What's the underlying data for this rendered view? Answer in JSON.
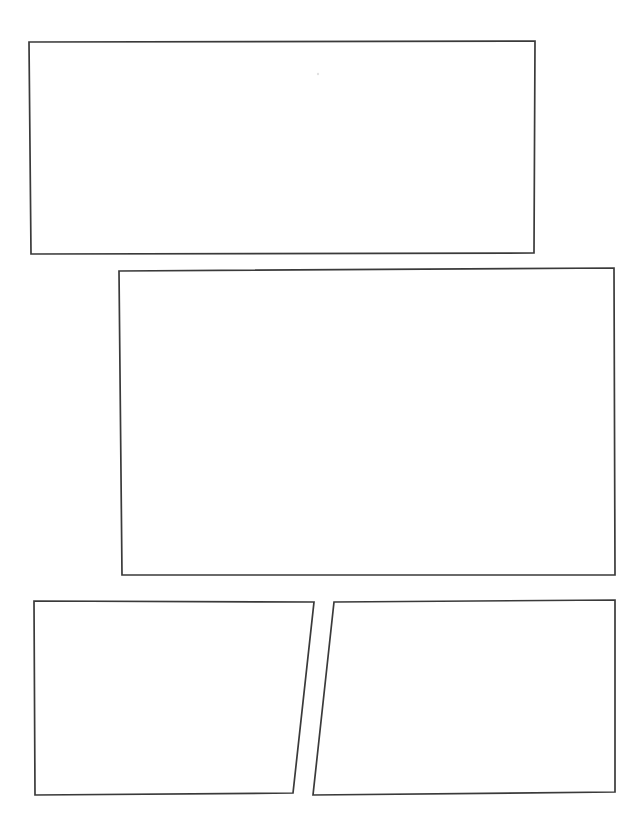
{
  "document": {
    "kind": "scanned-page",
    "title": "Blank Comic Panel Layout",
    "page_width": 641,
    "page_height": 815,
    "background_color": "#ffffff",
    "ink_color": "#3a3a3a",
    "stroke_width": 1.7,
    "visible_text": "",
    "notes": "Empty hand-drawn panel borders only; no text, labels or artwork rendered on the page."
  },
  "panels": [
    {
      "id": "panel-1",
      "label": "",
      "row": 1,
      "position": "top",
      "content": "",
      "points": "29,42 535,41 534,253 31,254"
    },
    {
      "id": "panel-2",
      "label": "",
      "row": 2,
      "position": "middle",
      "content": "",
      "points": "119,271 614,268 615,575 122,575"
    },
    {
      "id": "panel-3",
      "label": "",
      "row": 3,
      "position": "bottom-left",
      "content": "",
      "points": "34,601 314,602 293,793 35,795"
    },
    {
      "id": "panel-4",
      "label": "",
      "row": 3,
      "position": "bottom-right",
      "content": "",
      "points": "334,602 615,600 615,792 313,795"
    }
  ],
  "marks": [
    {
      "id": "speck-1",
      "x": 318,
      "y": 74,
      "r": 1.2
    }
  ]
}
